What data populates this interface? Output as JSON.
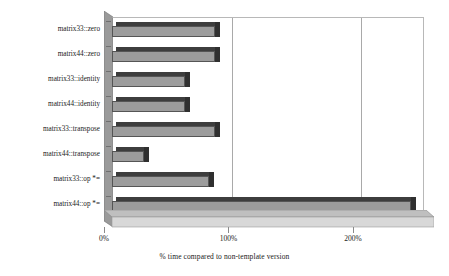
{
  "chart_data": {
    "type": "bar",
    "orientation": "horizontal",
    "title": "",
    "subtitle": "",
    "xlabel": "% time compared to non-template version",
    "ylabel": "",
    "categories": [
      "matrix33::zero",
      "matrix44::zero",
      "matrix33::identity",
      "matrix44::identity",
      "matrix33::transpose",
      "matrix44::transpose",
      "matrix33::op *=",
      "matrix44::op *="
    ],
    "values": [
      83,
      83,
      59,
      59,
      83,
      26,
      78,
      240
    ],
    "xlim": [
      0,
      250
    ],
    "xticks": [
      0,
      100,
      200
    ],
    "xtick_labels": [
      "0%",
      "100%",
      "200%"
    ],
    "grid": "vertical",
    "legend": "none",
    "style": "3d-bar",
    "colors": {
      "bar_face": "#9c9c9c",
      "bar_top": "#3d3d3d",
      "bar_side": "#2f2f2f",
      "gridline": "#a9a9a9",
      "plot_background": "#ffffff",
      "floor": "#d2d2d2",
      "wall": "#9a9a9a",
      "text": "#1a1a1a"
    }
  }
}
